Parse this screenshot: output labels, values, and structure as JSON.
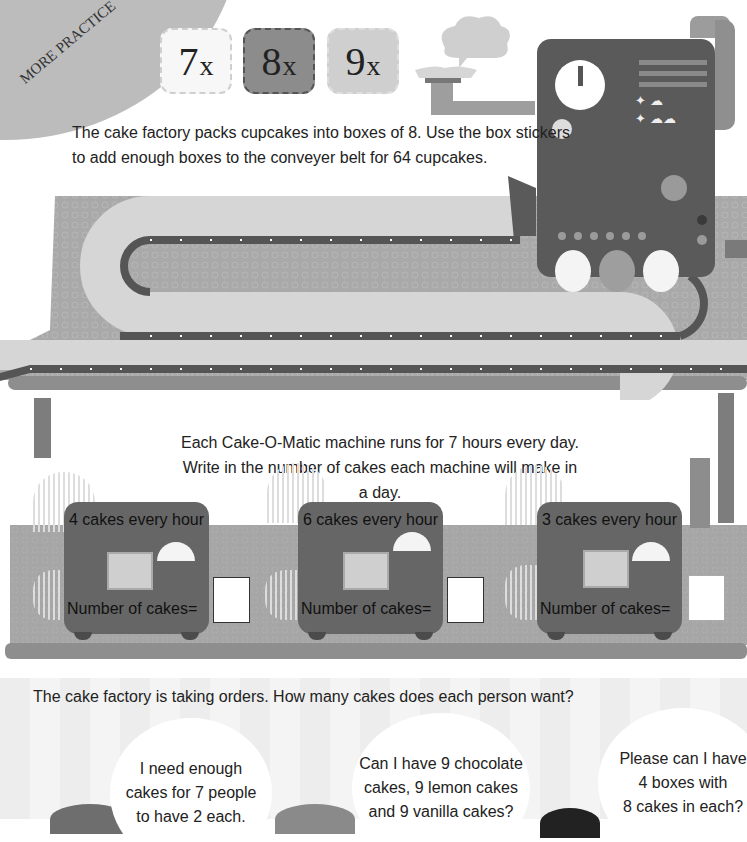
{
  "banner": {
    "label": "MORE PRACTICE"
  },
  "stickers": [
    {
      "num": "7",
      "suffix": "x"
    },
    {
      "num": "8",
      "suffix": "x"
    },
    {
      "num": "9",
      "suffix": "x"
    }
  ],
  "task1": {
    "line1": "The cake factory packs cupcakes into boxes of 8. Use the box stickers",
    "line2": "to add enough boxes to the conveyer belt for 64 cupcakes."
  },
  "task2": {
    "line1": "Each Cake-O-Matic machine runs for 7 hours every day.",
    "line2": "Write in the number of cakes each machine will make in a day."
  },
  "machines": [
    {
      "rate": "4 cakes every hour",
      "label": "Number of cakes=",
      "cake": "doughnut-icon",
      "answer": ""
    },
    {
      "rate": "6 cakes every hour",
      "label": "Number of cakes=",
      "cake": "bundt-cake-icon",
      "answer": ""
    },
    {
      "rate": "3 cakes every hour",
      "label": "Number of cakes=",
      "cake": "swiss-roll-icon",
      "answer": ""
    }
  ],
  "orders": {
    "title": "The cake factory is taking orders. How many cakes does each person want?",
    "bubbles": [
      {
        "l1": "I need enough",
        "l2": "cakes for 7 people",
        "l3": "to have 2 each."
      },
      {
        "l1": "Can I have 9 chocolate",
        "l2": "cakes, 9 lemon cakes",
        "l3": "and 9 vanilla cakes?"
      },
      {
        "l1": "Please can I have",
        "l2": "4 boxes with",
        "l3": "8 cakes in each?"
      }
    ]
  },
  "colors": {
    "machine": "#5a5a5a",
    "table": "#a8a8a8",
    "belt": "#555555",
    "banner": "#bcbcbc"
  }
}
